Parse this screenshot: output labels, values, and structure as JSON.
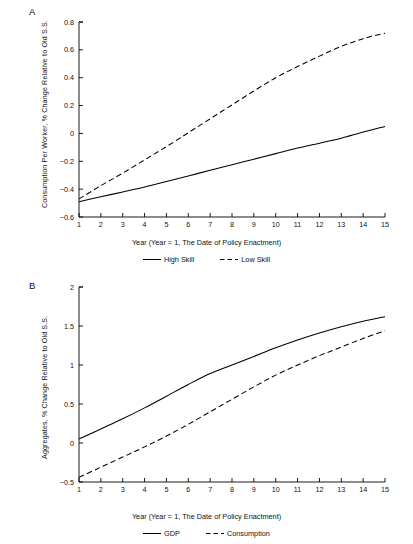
{
  "figure": {
    "panels": [
      {
        "letter": "A",
        "ylabel": "Consumption Per Worker, % Change Relative to Old S.S.",
        "xlabel": "Year  (Year = 1, The Date of Policy Enactment)",
        "legend": [
          {
            "label": "High Skill",
            "style": "solid"
          },
          {
            "label": "Low Skill",
            "style": "dashed"
          }
        ]
      },
      {
        "letter": "B",
        "ylabel": "Aggregates, % Change Relative to Old S.S.",
        "xlabel": "Year  (Year = 1, The Date of Policy Enactment)",
        "legend": [
          {
            "label": "GDP",
            "style": "solid"
          },
          {
            "label": "Consumption",
            "style": "dashed"
          }
        ]
      }
    ]
  },
  "chart_data": [
    {
      "type": "line",
      "panel": "A",
      "title": "",
      "xlabel": "Year  (Year = 1, The Date of Policy Enactment)",
      "ylabel": "Consumption Per Worker, % Change Relative to Old S.S.",
      "x": [
        1,
        2,
        3,
        4,
        5,
        6,
        7,
        8,
        9,
        10,
        11,
        12,
        13,
        14,
        15
      ],
      "xlim": [
        1,
        15
      ],
      "ylim": [
        -0.6,
        0.8
      ],
      "xticks": [
        1,
        2,
        3,
        4,
        5,
        6,
        7,
        8,
        9,
        10,
        11,
        12,
        13,
        14,
        15
      ],
      "yticks": [
        -0.6,
        -0.4,
        -0.2,
        0,
        0.2,
        0.4,
        0.6,
        0.8
      ],
      "ytick_labels": [
        "-0.6",
        "-0.4",
        "-0.2",
        "0",
        "0.2",
        "0.4",
        "0.6",
        "0.8"
      ],
      "grid": false,
      "legend_position": "below",
      "series": [
        {
          "name": "High Skill",
          "style": "solid",
          "values": [
            -0.49,
            -0.455,
            -0.42,
            -0.385,
            -0.345,
            -0.305,
            -0.265,
            -0.225,
            -0.185,
            -0.145,
            -0.105,
            -0.07,
            -0.035,
            0.01,
            0.05
          ]
        },
        {
          "name": "Low Skill",
          "style": "dashed",
          "values": [
            -0.47,
            -0.375,
            -0.285,
            -0.19,
            -0.095,
            0.005,
            0.105,
            0.205,
            0.305,
            0.4,
            0.48,
            0.555,
            0.625,
            0.68,
            0.72
          ]
        }
      ]
    },
    {
      "type": "line",
      "panel": "B",
      "title": "",
      "xlabel": "Year  (Year = 1, The Date of Policy Enactment)",
      "ylabel": "Aggregates, % Change Relative to Old S.S.",
      "x": [
        1,
        2,
        3,
        4,
        5,
        6,
        7,
        8,
        9,
        10,
        11,
        12,
        13,
        14,
        15
      ],
      "xlim": [
        1,
        15
      ],
      "ylim": [
        -0.5,
        2.0
      ],
      "xticks": [
        1,
        2,
        3,
        4,
        5,
        6,
        7,
        8,
        9,
        10,
        11,
        12,
        13,
        14,
        15
      ],
      "yticks": [
        -0.5,
        0,
        0.5,
        1.0,
        1.5,
        2.0
      ],
      "ytick_labels": [
        "-0.5",
        "0",
        "0.5",
        "1",
        "1.5",
        "2"
      ],
      "grid": false,
      "legend_position": "below",
      "series": [
        {
          "name": "GDP",
          "style": "solid",
          "values": [
            0.05,
            0.18,
            0.31,
            0.45,
            0.6,
            0.75,
            0.89,
            1.0,
            1.11,
            1.22,
            1.32,
            1.41,
            1.49,
            1.56,
            1.62
          ]
        },
        {
          "name": "Consumption",
          "style": "dashed",
          "values": [
            -0.44,
            -0.31,
            -0.18,
            -0.05,
            0.09,
            0.24,
            0.4,
            0.56,
            0.72,
            0.87,
            1.0,
            1.12,
            1.23,
            1.34,
            1.44
          ]
        }
      ]
    }
  ]
}
